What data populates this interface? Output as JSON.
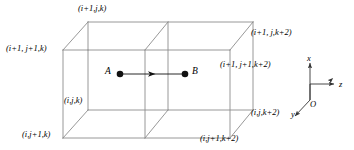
{
  "figure": {
    "type": "3d-grid-cell-diagram",
    "line_color": "#8c8c8c",
    "text_color": "#000000",
    "background": "#ffffff"
  },
  "vertex_labels": [
    {
      "id": "top-back-left",
      "text": "(i+1,j,k)",
      "x": 78,
      "y": 4
    },
    {
      "id": "top-front-left",
      "text": "(i+1, j+1,k)",
      "x": 6,
      "y": 44
    },
    {
      "id": "top-back-right",
      "text": "(i+1, j,k+2)",
      "x": 251,
      "y": 28
    },
    {
      "id": "top-front-right",
      "text": "(i+1, j+1,k+2)",
      "x": 220,
      "y": 60
    },
    {
      "id": "bot-back-left",
      "text": "(i,j,k)",
      "x": 64,
      "y": 96
    },
    {
      "id": "bot-front-left",
      "text": "(i,j+1,k)",
      "x": 22,
      "y": 130
    },
    {
      "id": "bot-back-right",
      "text": "(i,j,k+2)",
      "x": 251,
      "y": 108
    },
    {
      "id": "bot-front-right",
      "text": "(i,j+1,k+2)",
      "x": 200,
      "y": 134
    }
  ],
  "points": [
    {
      "id": "point-a",
      "label": "A",
      "label_x": 105,
      "label_y": 67,
      "dot_x": 120,
      "dot_y": 74
    },
    {
      "id": "point-b",
      "label": "B",
      "label_x": 192,
      "label_y": 67,
      "dot_x": 185,
      "dot_y": 74
    }
  ],
  "arrow": {
    "name": "a-to-b-arrow",
    "from_x": 120,
    "to_x": 185,
    "y": 74
  },
  "axes": {
    "origin_label": "O",
    "origin_x": 310,
    "origin_y": 100,
    "items": [
      {
        "id": "axis-x",
        "label": "x",
        "label_x": 307,
        "label_y": 54
      },
      {
        "id": "axis-z",
        "label": "z",
        "label_x": 339,
        "label_y": 80
      },
      {
        "id": "axis-y",
        "label": "y",
        "label_x": 291,
        "label_y": 110
      }
    ]
  }
}
